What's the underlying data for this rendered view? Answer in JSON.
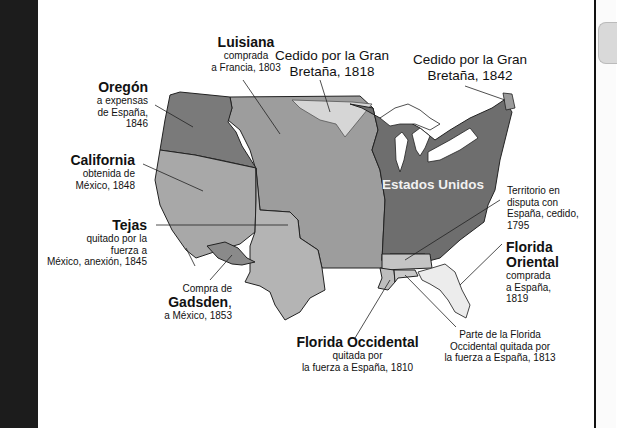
{
  "map": {
    "colors": {
      "background": "#ffffff",
      "left_strip": "#1c1c1c",
      "estados_unidos": "#6e6e6e",
      "luisiana": "#9d9d9d",
      "oregon": "#7a7a7a",
      "california": "#a8a8a8",
      "tejas": "#b4b4b4",
      "cedido_1818": "#d6d6d6",
      "cedido_1842": "#9a9a9a",
      "gadsden": "#8a8a8a",
      "florida_oriental": "#ececec",
      "florida_occidental": "#bdbdbd",
      "territorio_disputa": "#c4c4c4",
      "lakes": "#ffffff",
      "borders": "#222222"
    },
    "regions": [
      {
        "id": "luisiana",
        "title": "Luisiana",
        "lines": [
          "comprada",
          "a Francia, 1803"
        ]
      },
      {
        "id": "cedido_1818",
        "title": "",
        "lines": [
          "Cedido por la Gran",
          "Bretaña, 1818"
        ]
      },
      {
        "id": "cedido_1842",
        "title": "",
        "lines": [
          "Cedido por la Gran",
          "Bretaña, 1842"
        ]
      },
      {
        "id": "oregon",
        "title": "Oregón",
        "lines": [
          "a expensas",
          "de España,",
          "1846"
        ]
      },
      {
        "id": "california",
        "title": "California",
        "lines": [
          "obtenida de",
          "México, 1848"
        ]
      },
      {
        "id": "estados_unidos",
        "title": "Estados Unidos",
        "lines": []
      },
      {
        "id": "territorio_disputa",
        "title": "",
        "lines": [
          "Territorio en",
          "disputa con",
          "España, cedido,",
          "1795"
        ]
      },
      {
        "id": "tejas",
        "title": "Tejas",
        "lines": [
          "quitado por la",
          "fuerza a",
          "México, anexión, 1845"
        ]
      },
      {
        "id": "florida_oriental",
        "title": "Florida Oriental",
        "title_lines": [
          "Florida",
          "Oriental"
        ],
        "lines": [
          "comprada",
          "a España,",
          "1819"
        ]
      },
      {
        "id": "gadsden",
        "title": "Gadsden",
        "pre": "Compra de",
        "lines": [
          "a México, 1853"
        ]
      },
      {
        "id": "florida_occidental",
        "title": "Florida Occidental",
        "lines": [
          "quitada por",
          "la fuerza a España, 1810"
        ]
      },
      {
        "id": "florida_occidental_1813",
        "title": "",
        "lines": [
          "Parte de la Florida",
          "Occidental quitada por",
          "la fuerza a España, 1813"
        ]
      }
    ]
  }
}
